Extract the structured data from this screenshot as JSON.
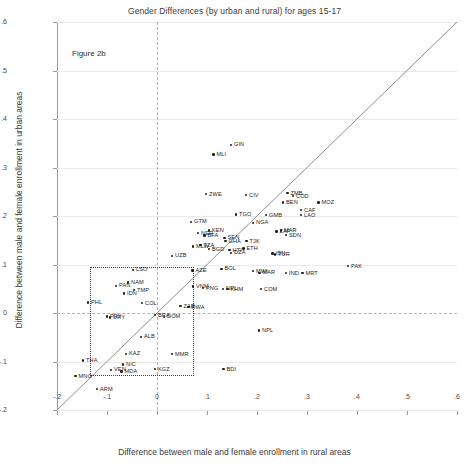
{
  "figure": {
    "title": "Gender Differences (by urban and rural) for ages 15-17",
    "tag": "Figure 2b"
  },
  "chart_data": {
    "type": "scatter",
    "title": "Gender Differences (by urban and rural) for ages 15-17",
    "annotation": "Figure 2b",
    "xlabel": "Difference between male and female enrollment in rural areas",
    "ylabel": "Difference between male and female enrollment in urban areas",
    "xlim": [
      -0.2,
      0.6
    ],
    "ylim": [
      -0.2,
      0.6
    ],
    "xticks": [
      "-.2",
      "-.1",
      "0",
      ".1",
      ".2",
      ".3",
      ".4",
      ".5",
      ".6"
    ],
    "yticks": [
      "-.2",
      "-.1",
      "0",
      ".1",
      ".2",
      ".3",
      ".4",
      ".5",
      ".6"
    ],
    "xtick_values": [
      -0.2,
      -0.1,
      0,
      0.1,
      0.2,
      0.3,
      0.4,
      0.5,
      0.6
    ],
    "ytick_values": [
      -0.2,
      -0.1,
      0,
      0.1,
      0.2,
      0.3,
      0.4,
      0.5,
      0.6
    ],
    "grid": "horizontal",
    "legend": "none",
    "reference_lines": [
      {
        "name": "identity-line",
        "type": "diagonal",
        "from": [
          -0.2,
          -0.2
        ],
        "to": [
          0.6,
          0.6
        ]
      },
      {
        "name": "zero-horizontal",
        "type": "hline",
        "value": 0,
        "style": "dashed"
      },
      {
        "name": "zero-vertical",
        "type": "vline",
        "value": 0,
        "style": "dashed"
      }
    ],
    "highlight_box": {
      "x0": -0.135,
      "x1": 0.07,
      "y0": -0.125,
      "y1": 0.095,
      "style": "dotted"
    },
    "points": [
      {
        "label": "GIN",
        "x": 0.148,
        "y": 0.347
      },
      {
        "label": "MLI",
        "x": 0.113,
        "y": 0.327
      },
      {
        "label": "ZWE",
        "x": 0.098,
        "y": 0.245
      },
      {
        "label": "CIV",
        "x": 0.178,
        "y": 0.243
      },
      {
        "label": "ZMB",
        "x": 0.261,
        "y": 0.247
      },
      {
        "label": "COD",
        "x": 0.272,
        "y": 0.241
      },
      {
        "label": "MOZ",
        "x": 0.323,
        "y": 0.228
      },
      {
        "label": "BEN",
        "x": 0.252,
        "y": 0.228
      },
      {
        "label": "CAF",
        "x": 0.288,
        "y": 0.212
      },
      {
        "label": "LAO",
        "x": 0.288,
        "y": 0.202
      },
      {
        "label": "TGO",
        "x": 0.158,
        "y": 0.203
      },
      {
        "label": "GMB",
        "x": 0.218,
        "y": 0.202
      },
      {
        "label": "NGA",
        "x": 0.192,
        "y": 0.186
      },
      {
        "label": "GTM",
        "x": 0.068,
        "y": 0.188
      },
      {
        "label": "ZAF",
        "x": 0.239,
        "y": 0.168
      },
      {
        "label": "MAR",
        "x": 0.248,
        "y": 0.17
      },
      {
        "label": "SDN",
        "x": 0.258,
        "y": 0.161
      },
      {
        "label": "KEN",
        "x": 0.104,
        "y": 0.17
      },
      {
        "label": "NER",
        "x": 0.082,
        "y": 0.165
      },
      {
        "label": "BFA",
        "x": 0.095,
        "y": 0.16
      },
      {
        "label": "SEN",
        "x": 0.135,
        "y": 0.155
      },
      {
        "label": "GHA",
        "x": 0.137,
        "y": 0.148
      },
      {
        "label": "TJK",
        "x": 0.179,
        "y": 0.148
      },
      {
        "label": "MLW",
        "x": 0.072,
        "y": 0.137
      },
      {
        "label": "TZA",
        "x": 0.087,
        "y": 0.14
      },
      {
        "label": "BGD",
        "x": 0.104,
        "y": 0.132
      },
      {
        "label": "HTI",
        "x": 0.145,
        "y": 0.13
      },
      {
        "label": "DZA",
        "x": 0.148,
        "y": 0.124
      },
      {
        "label": "ETH",
        "x": 0.173,
        "y": 0.133
      },
      {
        "label": "IDN2",
        "x": 0.231,
        "y": 0.123
      },
      {
        "label": "TUR",
        "x": 0.236,
        "y": 0.121
      },
      {
        "label": "UZB",
        "x": 0.03,
        "y": 0.118
      },
      {
        "label": "LSO",
        "x": -0.048,
        "y": 0.089
      },
      {
        "label": "AZE",
        "x": 0.071,
        "y": 0.088
      },
      {
        "label": "BOL",
        "x": 0.129,
        "y": 0.091
      },
      {
        "label": "MWI",
        "x": 0.192,
        "y": 0.086
      },
      {
        "label": "MAR2",
        "x": 0.205,
        "y": 0.083
      },
      {
        "label": "IND",
        "x": 0.258,
        "y": 0.082
      },
      {
        "label": "MRT",
        "x": 0.291,
        "y": 0.082
      },
      {
        "label": "PAK",
        "x": 0.382,
        "y": 0.097
      },
      {
        "label": "NAM",
        "x": -0.058,
        "y": 0.063
      },
      {
        "label": "PAN",
        "x": -0.082,
        "y": 0.056
      },
      {
        "label": "TMP",
        "x": -0.046,
        "y": 0.047
      },
      {
        "label": "IDN",
        "x": -0.066,
        "y": 0.04
      },
      {
        "label": "VNM",
        "x": 0.072,
        "y": 0.055
      },
      {
        "label": "PNG",
        "x": 0.092,
        "y": 0.051
      },
      {
        "label": "NPL2",
        "x": 0.132,
        "y": 0.05
      },
      {
        "label": "KHM",
        "x": 0.141,
        "y": 0.049
      },
      {
        "label": "COM",
        "x": 0.208,
        "y": 0.049
      },
      {
        "label": "PHL",
        "x": -0.138,
        "y": 0.022
      },
      {
        "label": "COL",
        "x": -0.03,
        "y": 0.02
      },
      {
        "label": "ZAR",
        "x": 0.047,
        "y": 0.014
      },
      {
        "label": "RWA",
        "x": 0.063,
        "y": 0.012
      },
      {
        "label": "BRA",
        "x": -0.004,
        "y": -0.004
      },
      {
        "label": "DOM",
        "x": 0.014,
        "y": -0.008
      },
      {
        "label": "URY",
        "x": -0.094,
        "y": -0.009
      },
      {
        "label": "PRY",
        "x": -0.1,
        "y": -0.007
      },
      {
        "label": "ALB",
        "x": -0.032,
        "y": -0.049
      },
      {
        "label": "KAZ",
        "x": -0.062,
        "y": -0.084
      },
      {
        "label": "MMR",
        "x": 0.03,
        "y": -0.085
      },
      {
        "label": "THA",
        "x": -0.148,
        "y": -0.098
      },
      {
        "label": "NIC",
        "x": -0.068,
        "y": -0.106
      },
      {
        "label": "VEN",
        "x": -0.092,
        "y": -0.117
      },
      {
        "label": "MDA",
        "x": -0.071,
        "y": -0.121
      },
      {
        "label": "KGZ",
        "x": -0.004,
        "y": -0.116
      },
      {
        "label": "BDI",
        "x": 0.133,
        "y": -0.116
      },
      {
        "label": "MNG",
        "x": -0.163,
        "y": -0.13
      },
      {
        "label": "ARM",
        "x": -0.12,
        "y": -0.157
      },
      {
        "label": "NPL",
        "x": 0.204,
        "y": -0.036
      }
    ]
  }
}
